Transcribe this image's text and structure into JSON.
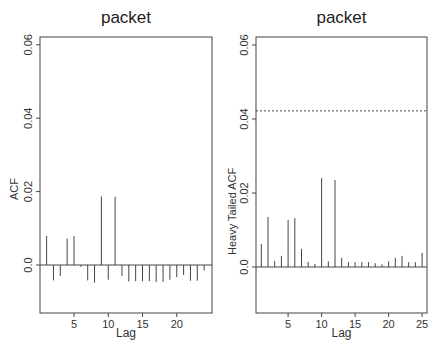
{
  "chart_data": [
    {
      "type": "bar",
      "title": "packet",
      "xlabel": "Lag",
      "ylabel": "ACF",
      "ylim": [
        -0.013,
        0.062
      ],
      "xlim": [
        0,
        25
      ],
      "y_ticks": [
        0.0,
        0.02,
        0.04,
        0.06
      ],
      "y_tick_labels": [
        "0.0",
        "0.02",
        "0.04",
        "0.06"
      ],
      "x_ticks": [
        5,
        10,
        15,
        20
      ],
      "x_tick_labels": [
        "5",
        "10",
        "15",
        "20"
      ],
      "grid": false,
      "x": [
        1,
        2,
        3,
        4,
        5,
        6,
        7,
        8,
        9,
        10,
        11,
        12,
        13,
        14,
        15,
        16,
        17,
        18,
        19,
        20,
        21,
        22,
        23,
        24
      ],
      "values": [
        0.0079,
        -0.0042,
        -0.003,
        0.0072,
        0.0079,
        -0.0005,
        -0.0042,
        -0.0048,
        0.0187,
        -0.004,
        0.0186,
        -0.003,
        -0.0045,
        -0.0044,
        -0.0044,
        -0.0044,
        -0.0046,
        -0.0046,
        -0.004,
        -0.0033,
        -0.0027,
        -0.0043,
        -0.0043,
        -0.0015
      ],
      "reference_line": null
    },
    {
      "type": "bar",
      "title": "packet",
      "xlabel": "Lag",
      "ylabel": "Heavy Tailed ACF",
      "ylim": [
        -0.013,
        0.062
      ],
      "xlim": [
        0,
        26
      ],
      "y_ticks": [
        0.0,
        0.02,
        0.04,
        0.06
      ],
      "y_tick_labels": [
        "0.0",
        "0.02",
        "0.04",
        "0.06"
      ],
      "x_ticks": [
        5,
        10,
        15,
        20,
        25
      ],
      "x_tick_labels": [
        "5",
        "10",
        "15",
        "20",
        "25"
      ],
      "grid": false,
      "x": [
        1,
        2,
        3,
        4,
        5,
        6,
        7,
        8,
        9,
        10,
        11,
        12,
        13,
        14,
        15,
        16,
        17,
        18,
        19,
        20,
        21,
        22,
        23,
        24,
        25
      ],
      "values": [
        0.0062,
        0.0135,
        0.0016,
        0.003,
        0.0127,
        0.0132,
        0.0049,
        0.0014,
        0.0008,
        0.024,
        0.0015,
        0.0235,
        0.0025,
        0.0013,
        0.0013,
        0.0013,
        0.0013,
        0.001,
        0.0007,
        0.0015,
        0.0025,
        0.003,
        0.0013,
        0.0013,
        0.0038
      ],
      "reference_line": {
        "y": 0.0422,
        "style": "dotted"
      }
    }
  ],
  "layout": {
    "panels": [
      {
        "frame": {
          "x0": 40,
          "x1": 212,
          "y0": 37,
          "y1": 313
        },
        "zero_y": 265,
        "px_per_unit": 3670,
        "lag1_x": 46.6,
        "px_per_lag": 6.85
      },
      {
        "frame": {
          "x0": 36,
          "x1": 207,
          "y0": 37,
          "y1": 313
        },
        "zero_y": 267,
        "px_per_unit": 3700,
        "lag1_x": 41.3,
        "px_per_lag": 6.7
      }
    ]
  }
}
